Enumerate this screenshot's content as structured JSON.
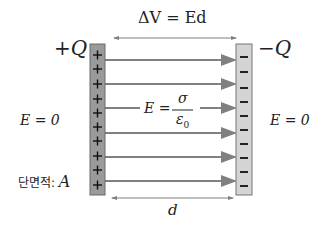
{
  "labels": {
    "voltage": "ΔV = Ed",
    "plus_q": "+Q",
    "minus_q": "−Q",
    "e_left": "E = 0",
    "e_right": "E = 0",
    "field_E": "E =",
    "field_num": "σ",
    "field_den": "ε",
    "field_den_sub": "0",
    "area_prefix": "단면적: ",
    "area_var": "A",
    "distance": "d"
  },
  "plates": {
    "positive": {
      "sign": "+",
      "count": 10,
      "fill": "#9a9a9a"
    },
    "negative": {
      "sign": "−",
      "count": 10,
      "fill": "#d4d4d4"
    }
  },
  "field_lines": 6,
  "colors": {
    "arrow": "#808080",
    "text": "#222222",
    "outline": "#777777"
  }
}
